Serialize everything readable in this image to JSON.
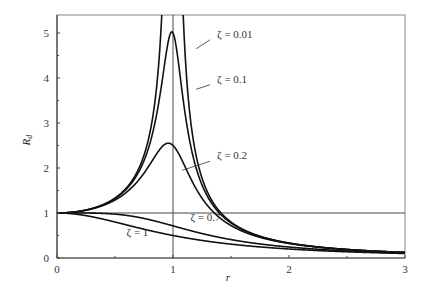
{
  "chart_data": {
    "type": "line",
    "title": "",
    "xlabel": "r",
    "ylabel": "R_d",
    "xlim": [
      0,
      3
    ],
    "ylim": [
      0,
      5.45
    ],
    "xticks": [
      "0",
      "1",
      "2",
      "3"
    ],
    "yticks": [
      "0",
      "1",
      "2",
      "3",
      "4",
      "5"
    ],
    "grid": false,
    "formula": "R_d = 1 / sqrt((1 - r^2)^2 + (2*zeta*r)^2)",
    "reference_lines": [
      {
        "orientation": "vertical",
        "x": 1
      },
      {
        "orientation": "horizontal",
        "y": 1
      }
    ],
    "series": [
      {
        "name": "ζ = 0.01",
        "zeta": 0.01,
        "peak": 50
      },
      {
        "name": "ζ = 0.1",
        "zeta": 0.1,
        "peak": 5.03
      },
      {
        "name": "ζ = 0.2",
        "zeta": 0.2,
        "peak": 2.55
      },
      {
        "name": "ζ = 0.7",
        "zeta": 0.7,
        "peak": 1.0
      },
      {
        "name": "ζ = 1",
        "zeta": 1.0,
        "peak": 1.0
      }
    ],
    "annotations": [
      {
        "text": "ζ = 0.01",
        "x": 1.38,
        "y": 4.9
      },
      {
        "text": "ζ = 0.1",
        "x": 1.38,
        "y": 3.9
      },
      {
        "text": "ζ = 0.2",
        "x": 1.38,
        "y": 2.2
      },
      {
        "text": "ζ = 0.7",
        "x": 1.15,
        "y": 0.82
      },
      {
        "text": "ζ = 1",
        "x": 0.6,
        "y": 0.5
      }
    ]
  }
}
